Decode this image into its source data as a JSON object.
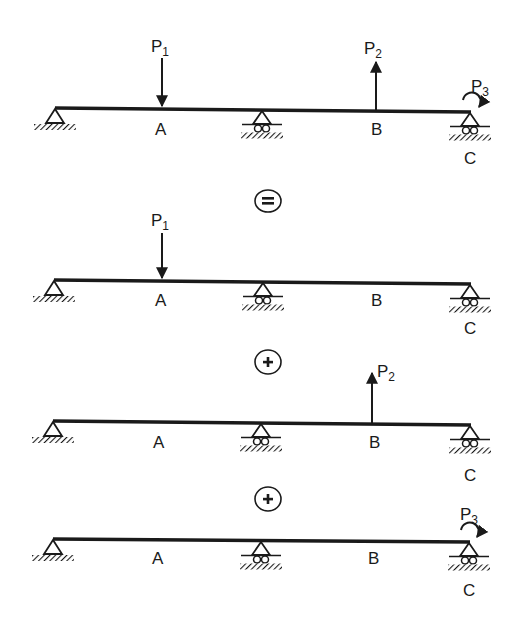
{
  "diagram": {
    "colors": {
      "ink": "#1a1a1a",
      "background": "#ffffff"
    },
    "labels": {
      "point_a": "A",
      "point_b": "B",
      "point_c": "C",
      "load_p": "P",
      "p1_sub": "1",
      "p2_sub": "2",
      "p3_sub": "3"
    },
    "operators": {
      "equals": "=",
      "plus": "+"
    },
    "beams": [
      {
        "id": "combined",
        "loads": [
          "P1 downward at A",
          "P2 upward at B",
          "P3 clockwise moment at C"
        ]
      },
      {
        "id": "case-1",
        "loads": [
          "P1 downward at A"
        ]
      },
      {
        "id": "case-2",
        "loads": [
          "P2 upward at B"
        ]
      },
      {
        "id": "case-3",
        "loads": [
          "P3 clockwise moment at C"
        ]
      }
    ],
    "supports": [
      "pin (left end)",
      "roller (middle)",
      "roller (C, right end)"
    ]
  }
}
